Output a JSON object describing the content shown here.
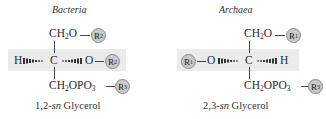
{
  "bacteria": {
    "title": "Bacteria",
    "top_group": "CH2O",
    "top_r": "R2",
    "left_atom": "H",
    "center": "C",
    "right_atom": "O",
    "middle_r": "R2",
    "bottom_group": "CH2OPO3",
    "bottom_r": "R3",
    "caption_prefix": "1,2-",
    "caption_sn": "sn",
    "caption_suffix": " Glycerol"
  },
  "archaea": {
    "title": "Archaea",
    "top_group": "CH2O",
    "top_r": "R1",
    "left_r": "R1",
    "left_atom": "O",
    "center": "C",
    "right_atom": "H",
    "bottom_group": "CH2OPO3",
    "bottom_r": "R3",
    "caption_prefix": "2,3-",
    "caption_sn": "sn",
    "caption_suffix": " Glycerol"
  },
  "colors": {
    "band": "#ebebeb",
    "r_circle": "#c9c9c9"
  }
}
